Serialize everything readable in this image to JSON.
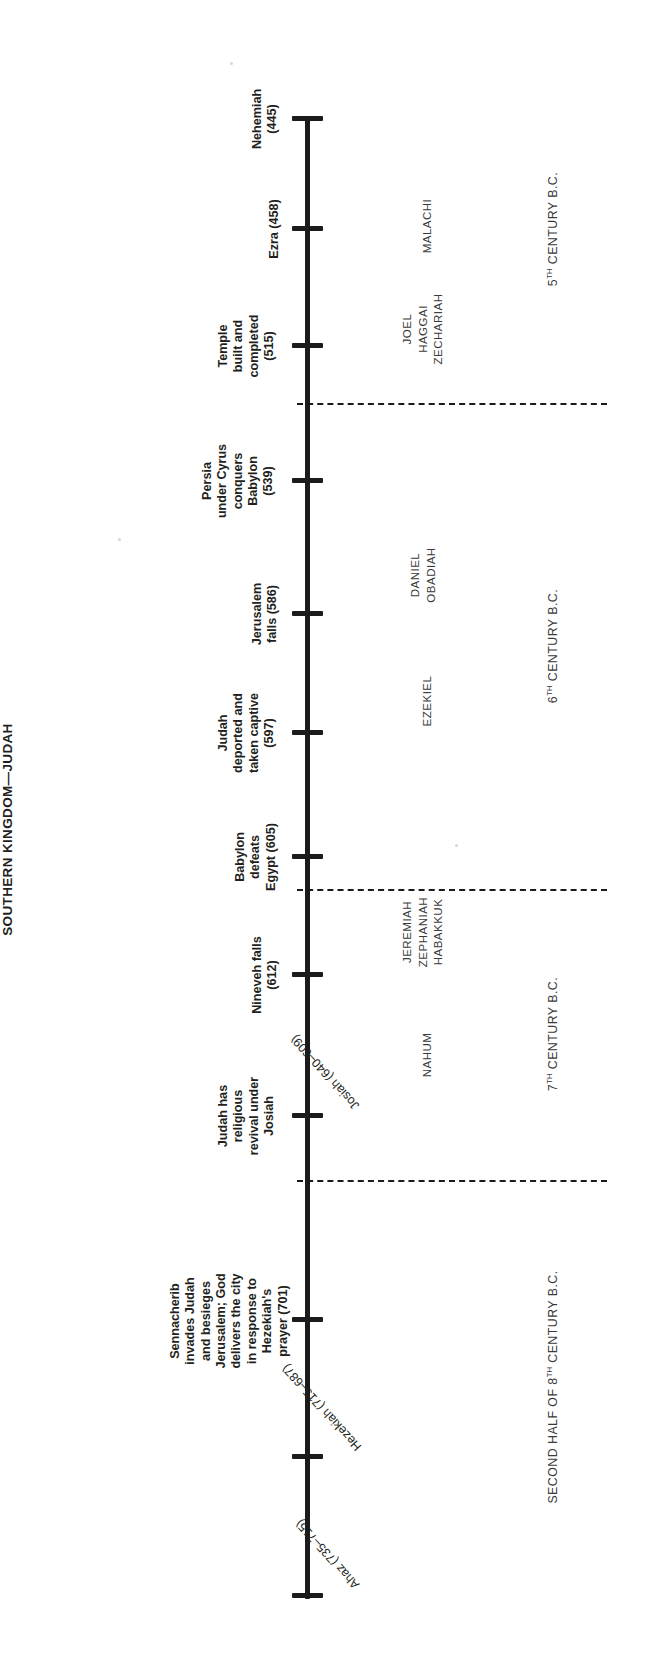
{
  "title": "SOUTHERN KINGDOM—JUDAH",
  "axis": {
    "orientation": "horizontal-rotated-90",
    "tick_count": 12
  },
  "events": [
    {
      "label": "Sennacherib\ninvades Judah\nand besieges\nJerusalem; God\ndelivers the city\nin response to\nHezekiah's\nprayer (701)",
      "year": 701
    },
    {
      "label": "Judah has\nreligious\nrevival under\nJosiah",
      "year": 622
    },
    {
      "label": "Nineveh falls\n(612)",
      "year": 612
    },
    {
      "label": "Babylon\ndefeats\nEgypt (605)",
      "year": 605
    },
    {
      "label": "Judah\ndeported and\ntaken captive\n(597)",
      "year": 597
    },
    {
      "label": "Jerusalem\nfalls (586)",
      "year": 586
    },
    {
      "label": "Persia\nunder Cyrus\nconquers\nBabylon\n(539)",
      "year": 539
    },
    {
      "label": "Temple\nbuilt and\ncompleted\n(515)",
      "year": 515
    },
    {
      "label": "Ezra (458)",
      "year": 458
    },
    {
      "label": "Nehemiah\n(445)",
      "year": 445
    }
  ],
  "prophets": [
    {
      "names": "NAHUM",
      "era": "7th century"
    },
    {
      "names": "JEREMIAH\nZEPHANIAH\nHABAKKUK",
      "era": "7th century"
    },
    {
      "names": "EZEKIEL",
      "era": "6th century"
    },
    {
      "names": "DANIEL\nOBADIAH",
      "era": "6th century"
    },
    {
      "names": "JOEL\nHAGGAI\nZECHARIAH",
      "era": "6th century"
    },
    {
      "names": "MALACHI",
      "era": "5th century"
    }
  ],
  "centuries": [
    {
      "prefix": "SECOND HALF OF 8",
      "ordinal": "TH",
      "suffix": " CENTURY B.C."
    },
    {
      "prefix": "7",
      "ordinal": "TH",
      "suffix": " CENTURY B.C."
    },
    {
      "prefix": "6",
      "ordinal": "TH",
      "suffix": " CENTURY B.C."
    },
    {
      "prefix": "5",
      "ordinal": "TH",
      "suffix": " CENTURY B.C."
    }
  ],
  "kings": [
    {
      "label": "Ahaz (735–715)"
    },
    {
      "label": "Hezekiah (715–687)"
    },
    {
      "label": "Josiah (640–609)"
    }
  ]
}
